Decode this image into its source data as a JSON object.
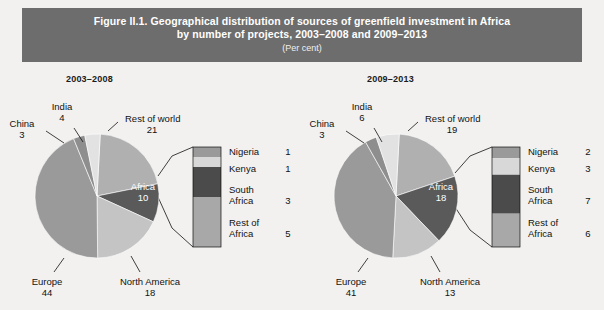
{
  "header": {
    "line1": "Figure II.1. Geographical distribution of sources of greenfield investment in Africa",
    "line2": "by number of projects, 2003–2008 and 2009–2013",
    "subtitle": "(Per cent)",
    "bg_color": "#6d6d6d",
    "text_color": "#ffffff"
  },
  "panels": [
    {
      "id": "left",
      "title": "2003–2008"
    },
    {
      "id": "right",
      "title": "2009–2013"
    }
  ],
  "colors": {
    "europe": "#9a9a9a",
    "north_america": "#c4c4c4",
    "africa": "#5a5a5a",
    "rest_of_world": "#b0b0b0",
    "india": "#e2e2e2",
    "china": "#8e8e8e",
    "nigeria": "#9a9a9a",
    "kenya": "#d8d8d8",
    "south_africa": "#4b4b4b",
    "rest_of_africa": "#a8a8a8",
    "page_bg": "#f2f1ef"
  },
  "chart_data": [
    {
      "type": "pie",
      "title": "2003–2008",
      "unit": "per cent",
      "categories": [
        "Rest of world",
        "Africa",
        "North America",
        "Europe",
        "China",
        "India"
      ],
      "values": [
        21,
        10,
        18,
        44,
        3,
        4
      ],
      "labels": [
        {
          "name": "Rest of world",
          "value": "21"
        },
        {
          "name": "Africa",
          "value": "10"
        },
        {
          "name": "North America",
          "value": "18"
        },
        {
          "name": "Europe",
          "value": "44"
        },
        {
          "name": "China",
          "value": "3"
        },
        {
          "name": "India",
          "value": "4"
        }
      ],
      "breakout": {
        "type": "bar",
        "of": "Africa",
        "categories": [
          "Nigeria",
          "Kenya",
          "South Africa",
          "Rest of Africa"
        ],
        "values": [
          1,
          1,
          3,
          5
        ],
        "legend": [
          {
            "name": "Nigeria",
            "value": "1"
          },
          {
            "name": "Kenya",
            "value": "1"
          },
          {
            "name": "South",
            "name2": "Africa",
            "value": "3"
          },
          {
            "name": "Rest of",
            "name2": "Africa",
            "value": "5"
          }
        ]
      }
    },
    {
      "type": "pie",
      "title": "2009–2013",
      "unit": "per cent",
      "categories": [
        "Rest of world",
        "Africa",
        "North America",
        "Europe",
        "China",
        "India"
      ],
      "values": [
        19,
        18,
        13,
        41,
        3,
        6
      ],
      "labels": [
        {
          "name": "Rest of world",
          "value": "19"
        },
        {
          "name": "Africa",
          "value": "18"
        },
        {
          "name": "North America",
          "value": "13"
        },
        {
          "name": "Europe",
          "value": "41"
        },
        {
          "name": "China",
          "value": "3"
        },
        {
          "name": "India",
          "value": "6"
        }
      ],
      "breakout": {
        "type": "bar",
        "of": "Africa",
        "categories": [
          "Nigeria",
          "Kenya",
          "South Africa",
          "Rest of Africa"
        ],
        "values": [
          2,
          3,
          7,
          6
        ],
        "legend": [
          {
            "name": "Nigeria",
            "value": "2"
          },
          {
            "name": "Kenya",
            "value": "3"
          },
          {
            "name": "South",
            "name2": "Africa",
            "value": "7"
          },
          {
            "name": "Rest of",
            "name2": "Africa",
            "value": "6"
          }
        ]
      }
    }
  ],
  "left": {
    "labels": {
      "india_name": "India",
      "india_val": "4",
      "china_name": "China",
      "china_val": "3",
      "row_name": "Rest of world",
      "row_val": "21",
      "africa_name": "Africa",
      "africa_val": "10",
      "europe_name": "Europe",
      "europe_val": "44",
      "na_name": "North America",
      "na_val": "18"
    },
    "legend": {
      "nigeria_name": "Nigeria",
      "nigeria_val": "1",
      "kenya_name": "Kenya",
      "kenya_val": "1",
      "sa_name1": "South",
      "sa_name2": "Africa",
      "sa_val": "3",
      "roa_name1": "Rest of",
      "roa_name2": "Africa",
      "roa_val": "5"
    }
  },
  "right": {
    "labels": {
      "india_name": "India",
      "india_val": "6",
      "china_name": "China",
      "china_val": "3",
      "row_name": "Rest of world",
      "row_val": "19",
      "africa_name": "Africa",
      "africa_val": "18",
      "europe_name": "Europe",
      "europe_val": "41",
      "na_name": "North America",
      "na_val": "13"
    },
    "legend": {
      "nigeria_name": "Nigeria",
      "nigeria_val": "2",
      "kenya_name": "Kenya",
      "kenya_val": "3",
      "sa_name1": "South",
      "sa_name2": "Africa",
      "sa_val": "7",
      "roa_name1": "Rest of",
      "roa_name2": "Africa",
      "roa_val": "6"
    }
  }
}
